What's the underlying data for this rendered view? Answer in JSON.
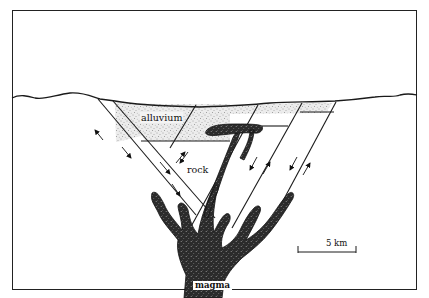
{
  "diagram": {
    "type": "geologic-cross-section",
    "labels": {
      "alluvium": "alluvium",
      "rock": "rock",
      "magma": "magma",
      "scale": "5 km"
    },
    "colors": {
      "ink": "#1a1a1a",
      "alluvium_fill": "#e8e8e8",
      "magma_fill": "#2a2a2a",
      "background": "#ffffff"
    },
    "elements": [
      {
        "name": "ground-surface",
        "description": "wavy topographic surface line"
      },
      {
        "name": "alluvium-fill",
        "description": "stippled sediment filling the graben"
      },
      {
        "name": "fault-blocks",
        "description": "tilted fault blocks with opposing slip arrows"
      },
      {
        "name": "magma-dikes",
        "description": "branching magma body rising from below"
      },
      {
        "name": "sill",
        "description": "magma sill intruding into alluvium"
      },
      {
        "name": "scale-bar",
        "description": "5 km scale bar"
      }
    ]
  }
}
